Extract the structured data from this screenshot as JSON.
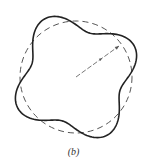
{
  "figure": {
    "caption": "(b)",
    "center": [
      76,
      77
    ],
    "reference_circle": {
      "style": "dashed",
      "radius": 56,
      "stroke": "#555555",
      "dash": "6 4"
    },
    "deformed_curve": {
      "style": "solid",
      "base_radius": 56,
      "amplitude": 10,
      "lobes": 4,
      "lobe_phase_deg": -28,
      "stroke": "#222222"
    },
    "radius_line": {
      "from": [
        76,
        77
      ],
      "to": [
        119,
        46
      ],
      "stroke": "#555555",
      "arrow_at_fraction": 0.55
    }
  }
}
